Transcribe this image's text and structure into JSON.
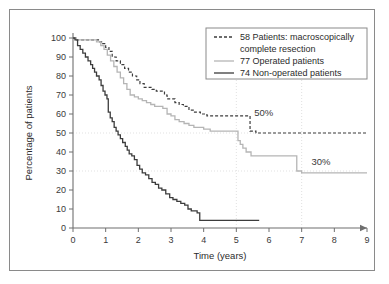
{
  "figure": {
    "border_color": "#8a8a8a",
    "background": "#ffffff"
  },
  "chart_data": {
    "type": "line",
    "subtype": "kaplan-meier-survival-step",
    "title": "",
    "xlabel": "Time (years)",
    "ylabel": "Percentage of patients",
    "xlim": [
      0,
      9
    ],
    "ylim": [
      0,
      100
    ],
    "xticks": [
      0,
      1,
      2,
      3,
      4,
      5,
      6,
      7,
      8,
      9
    ],
    "xticklabels": [
      "0",
      "1",
      "2",
      "3",
      "4",
      "5",
      "6",
      "7",
      "8",
      "9"
    ],
    "yticks": [
      0,
      10,
      20,
      30,
      40,
      50,
      60,
      70,
      80,
      90,
      100
    ],
    "yticklabels": [
      "0",
      "10",
      "20",
      "30",
      "40",
      "50",
      "60",
      "70",
      "80",
      "90",
      "100"
    ],
    "grid": true,
    "gridlines_horizontal": [
      30,
      50
    ],
    "gridlines_vertical": [
      5,
      7
    ],
    "legend_position": "top-right",
    "annotations": [
      {
        "text": "50%",
        "x": 5.55,
        "y": 59,
        "name": "annotation-50-percent"
      },
      {
        "text": "30%",
        "x": 7.3,
        "y": 33,
        "name": "annotation-30-percent"
      }
    ],
    "series": [
      {
        "name": "58 Patients: macroscopically complete resection",
        "label_line1": "58 Patients: macroscopically",
        "label_line2": "complete resection",
        "n": 58,
        "color": "#3c3c3c",
        "style": "dashed",
        "dasharray": "3,2",
        "width": 1.2,
        "points": [
          [
            0.0,
            100
          ],
          [
            0.08,
            99
          ],
          [
            0.7,
            99
          ],
          [
            0.78,
            98
          ],
          [
            0.9,
            97
          ],
          [
            1.0,
            95
          ],
          [
            1.1,
            93
          ],
          [
            1.2,
            90
          ],
          [
            1.32,
            88
          ],
          [
            1.45,
            86
          ],
          [
            1.58,
            84
          ],
          [
            1.7,
            82
          ],
          [
            1.82,
            80
          ],
          [
            1.95,
            78
          ],
          [
            2.05,
            76
          ],
          [
            2.18,
            74
          ],
          [
            2.3,
            74
          ],
          [
            2.42,
            73
          ],
          [
            2.55,
            72
          ],
          [
            2.68,
            72
          ],
          [
            2.8,
            70
          ],
          [
            2.88,
            68
          ],
          [
            3.0,
            68
          ],
          [
            3.12,
            66
          ],
          [
            3.25,
            65
          ],
          [
            3.38,
            64
          ],
          [
            3.55,
            62
          ],
          [
            3.72,
            61
          ],
          [
            3.9,
            60
          ],
          [
            4.1,
            59
          ],
          [
            4.35,
            59
          ],
          [
            4.7,
            59
          ],
          [
            5.05,
            59
          ],
          [
            5.35,
            59
          ],
          [
            5.42,
            51
          ],
          [
            5.6,
            50
          ],
          [
            6.2,
            50
          ],
          [
            7.0,
            50
          ],
          [
            8.0,
            50
          ],
          [
            9.0,
            50
          ]
        ]
      },
      {
        "name": "77 Operated patients",
        "label_line1": "77 Operated patients",
        "n": 77,
        "color": "#b5b5b5",
        "style": "solid",
        "dasharray": "none",
        "width": 1.3,
        "points": [
          [
            0.0,
            100
          ],
          [
            0.1,
            99
          ],
          [
            0.62,
            99
          ],
          [
            0.72,
            98
          ],
          [
            0.85,
            96
          ],
          [
            0.95,
            94
          ],
          [
            1.05,
            91
          ],
          [
            1.15,
            88
          ],
          [
            1.25,
            85
          ],
          [
            1.35,
            82
          ],
          [
            1.45,
            79
          ],
          [
            1.55,
            76
          ],
          [
            1.65,
            73
          ],
          [
            1.75,
            70
          ],
          [
            1.88,
            69
          ],
          [
            2.0,
            68
          ],
          [
            2.12,
            67
          ],
          [
            2.25,
            66
          ],
          [
            2.38,
            65
          ],
          [
            2.5,
            64
          ],
          [
            2.62,
            64
          ],
          [
            2.75,
            63
          ],
          [
            2.88,
            60
          ],
          [
            3.0,
            59
          ],
          [
            3.12,
            57
          ],
          [
            3.25,
            56
          ],
          [
            3.4,
            55
          ],
          [
            3.55,
            54
          ],
          [
            3.7,
            53
          ],
          [
            3.85,
            53
          ],
          [
            4.0,
            52
          ],
          [
            4.2,
            51
          ],
          [
            4.45,
            51
          ],
          [
            4.75,
            51
          ],
          [
            5.0,
            51
          ],
          [
            5.05,
            46
          ],
          [
            5.12,
            44
          ],
          [
            5.2,
            42
          ],
          [
            5.3,
            40
          ],
          [
            5.45,
            38
          ],
          [
            5.8,
            38
          ],
          [
            6.2,
            38
          ],
          [
            6.6,
            38
          ],
          [
            6.78,
            38
          ],
          [
            6.85,
            30
          ],
          [
            7.0,
            29
          ],
          [
            7.6,
            29
          ],
          [
            8.3,
            29
          ],
          [
            9.0,
            29
          ]
        ]
      },
      {
        "name": "74 Non-operated patients",
        "label_line1": "74 Non-operated patients",
        "n": 74,
        "color": "#3c3c3c",
        "style": "solid",
        "dasharray": "none",
        "width": 1.3,
        "points": [
          [
            0.0,
            100
          ],
          [
            0.06,
            99
          ],
          [
            0.14,
            96
          ],
          [
            0.22,
            94
          ],
          [
            0.3,
            92
          ],
          [
            0.38,
            90
          ],
          [
            0.46,
            88
          ],
          [
            0.54,
            86
          ],
          [
            0.6,
            84
          ],
          [
            0.66,
            82
          ],
          [
            0.72,
            80
          ],
          [
            0.8,
            78
          ],
          [
            0.86,
            75
          ],
          [
            0.92,
            72
          ],
          [
            0.98,
            70
          ],
          [
            1.04,
            68
          ],
          [
            1.08,
            61
          ],
          [
            1.14,
            58
          ],
          [
            1.2,
            56
          ],
          [
            1.26,
            53
          ],
          [
            1.32,
            51
          ],
          [
            1.38,
            49
          ],
          [
            1.45,
            47
          ],
          [
            1.52,
            45
          ],
          [
            1.6,
            43
          ],
          [
            1.66,
            41
          ],
          [
            1.72,
            39
          ],
          [
            1.8,
            38
          ],
          [
            1.88,
            36
          ],
          [
            1.96,
            33
          ],
          [
            2.04,
            31
          ],
          [
            2.12,
            29
          ],
          [
            2.22,
            28
          ],
          [
            2.32,
            26
          ],
          [
            2.42,
            24
          ],
          [
            2.52,
            23
          ],
          [
            2.62,
            21
          ],
          [
            2.72,
            20
          ],
          [
            2.84,
            18
          ],
          [
            2.96,
            16
          ],
          [
            3.06,
            15
          ],
          [
            3.18,
            14
          ],
          [
            3.3,
            13
          ],
          [
            3.42,
            12
          ],
          [
            3.52,
            10
          ],
          [
            3.62,
            9
          ],
          [
            3.72,
            9
          ],
          [
            3.8,
            8
          ],
          [
            3.88,
            4
          ],
          [
            4.1,
            4
          ],
          [
            4.6,
            4
          ],
          [
            5.1,
            4
          ],
          [
            5.5,
            4
          ],
          [
            5.7,
            4
          ]
        ]
      }
    ]
  },
  "legend": {
    "items": [
      {
        "label_line1": "58 Patients: macroscopically",
        "label_line2": "complete resection",
        "style": "dashed",
        "color": "#3c3c3c"
      },
      {
        "label_line1": "77 Operated patients",
        "label_line2": "",
        "style": "solid",
        "color": "#b5b5b5"
      },
      {
        "label_line1": "74 Non-operated patients",
        "label_line2": "",
        "style": "solid",
        "color": "#3c3c3c"
      }
    ]
  }
}
